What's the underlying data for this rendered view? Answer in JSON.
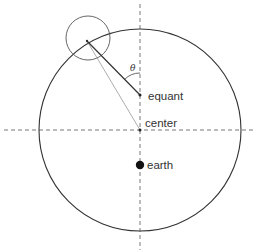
{
  "diagram": {
    "labels": {
      "equant": "equant",
      "center": "center",
      "earth": "earth",
      "angle": "θ"
    },
    "colors": {
      "stroke": "#333333",
      "thin_line": "#888888",
      "axis": "#555555",
      "background": "#ffffff"
    },
    "elements": [
      {
        "name": "deferent",
        "type": "circle",
        "cx": 140,
        "cy": 130,
        "r": 101
      },
      {
        "name": "epicycle",
        "type": "circle",
        "cx": 88,
        "cy": 38,
        "r": 22
      },
      {
        "name": "vertical-axis",
        "type": "dashed-line"
      },
      {
        "name": "horizontal-axis",
        "type": "dashed-line"
      },
      {
        "name": "equant-radius",
        "type": "line",
        "from": "equant",
        "to": "epicycle-center"
      },
      {
        "name": "center-radius",
        "type": "line",
        "from": "center",
        "to": "epicycle-center"
      },
      {
        "name": "angle-arc",
        "type": "arc",
        "label": "θ"
      }
    ]
  }
}
